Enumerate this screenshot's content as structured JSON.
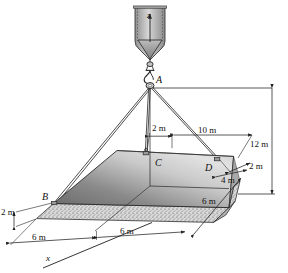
{
  "figure": {
    "type": "engineering-statics-diagram"
  },
  "axes": {
    "z_label": "z",
    "x_label": "x"
  },
  "points": {
    "a": "A",
    "b": "B",
    "c": "C",
    "d": "D"
  },
  "dimensions": {
    "c_offset": "2 m",
    "to_d": "10 m",
    "hook_height": "12 m",
    "d_edge": "2 m",
    "d_depth": "4 m",
    "b_offset": "2 m",
    "x_first": "6 m",
    "x_second": "6 m",
    "right_edge": "6 m"
  },
  "colors": {
    "plate_dark": "#6e6e6e",
    "plate_light": "#d9d9d9",
    "line": "#2b2b2b",
    "crane_body": "#9b9b9b"
  }
}
